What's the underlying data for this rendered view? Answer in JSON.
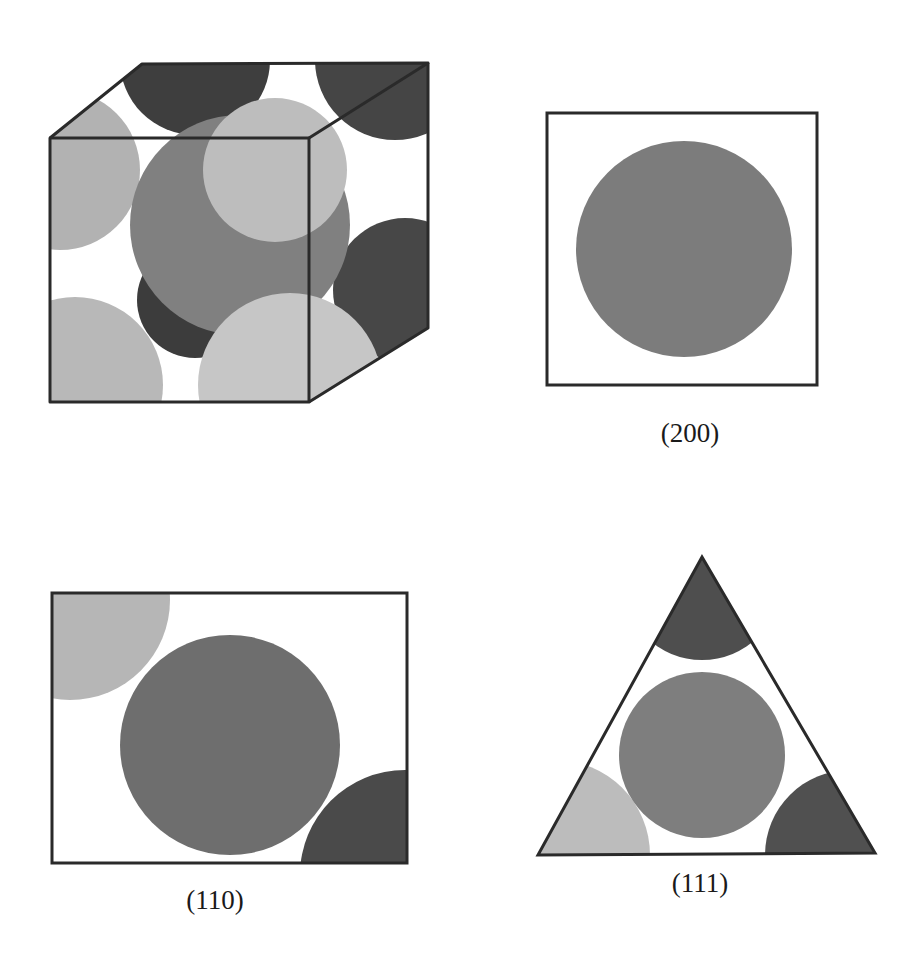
{
  "figure": {
    "colors": {
      "outline": "#2a2a2a",
      "dark_atom": "#4a4a4a",
      "mid_atom": "#7a7a7a",
      "light_atom": "#b4b4b4",
      "background": "#ffffff"
    },
    "panels": [
      {
        "id": "unit-cell",
        "caption": ""
      },
      {
        "id": "plane-200",
        "caption": "(200)"
      },
      {
        "id": "plane-110",
        "caption": "(110)"
      },
      {
        "id": "plane-111",
        "caption": "(111)"
      }
    ]
  }
}
